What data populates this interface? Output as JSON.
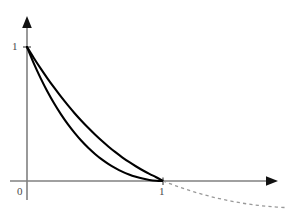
{
  "figure": {
    "background_color": "#ffffff",
    "axis_color": "#808080",
    "curve_color": "#000000",
    "dashed_color": "#999999",
    "label_color": "#4a4a4a"
  },
  "labels": {
    "origin": "0",
    "y_one": "1",
    "x_one": "1"
  },
  "chart_data": {
    "type": "line",
    "title": "",
    "subtitle": "",
    "xlabel": "",
    "ylabel": "",
    "xlim": [
      0,
      1.9
    ],
    "ylim": [
      -0.2,
      1.2
    ],
    "grid": false,
    "legend": null,
    "xticks": [
      0,
      1
    ],
    "xticklabels": [
      "0",
      "1"
    ],
    "yticks": [
      1
    ],
    "yticklabels": [
      "1"
    ],
    "axis_arrows": [
      "x-right",
      "y-up"
    ],
    "annotations": [],
    "series": [
      {
        "name": "upper-curve",
        "style": "solid",
        "color": "#000000",
        "x": [
          0.0,
          0.05,
          0.1,
          0.15,
          0.2,
          0.25,
          0.3,
          0.35,
          0.4,
          0.45,
          0.5,
          0.55,
          0.6,
          0.65,
          0.7,
          0.75,
          0.8,
          0.85,
          0.9,
          0.95,
          1.0
        ],
        "y": [
          1.0,
          0.918,
          0.84,
          0.766,
          0.696,
          0.629,
          0.566,
          0.506,
          0.45,
          0.397,
          0.347,
          0.3,
          0.256,
          0.215,
          0.177,
          0.142,
          0.11,
          0.08,
          0.053,
          0.028,
          0.0
        ]
      },
      {
        "name": "lower-curve",
        "style": "solid",
        "color": "#000000",
        "x": [
          0.0,
          0.05,
          0.1,
          0.15,
          0.2,
          0.25,
          0.3,
          0.35,
          0.4,
          0.45,
          0.5,
          0.55,
          0.6,
          0.65,
          0.7,
          0.75,
          0.8,
          0.85,
          0.9,
          0.95,
          1.0
        ],
        "y": [
          1.0,
          0.878,
          0.768,
          0.668,
          0.578,
          0.497,
          0.424,
          0.359,
          0.3,
          0.248,
          0.202,
          0.161,
          0.126,
          0.096,
          0.07,
          0.049,
          0.032,
          0.018,
          0.008,
          0.002,
          0.0
        ]
      },
      {
        "name": "dashed-continuation",
        "style": "dashed",
        "color": "#999999",
        "x": [
          1.0,
          1.1,
          1.2,
          1.3,
          1.4,
          1.5,
          1.6,
          1.7,
          1.8,
          1.9
        ],
        "y": [
          0.0,
          -0.038,
          -0.072,
          -0.102,
          -0.128,
          -0.15,
          -0.168,
          -0.182,
          -0.192,
          -0.198
        ]
      }
    ]
  }
}
